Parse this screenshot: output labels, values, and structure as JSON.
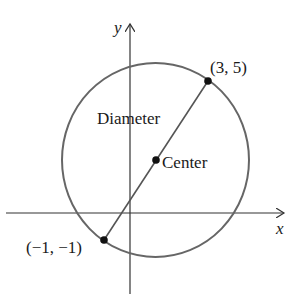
{
  "diagram": {
    "type": "circle-with-diameter",
    "axes": {
      "x_label": "x",
      "y_label": "y"
    },
    "labels": {
      "endpoint_upper": "(3, 5)",
      "endpoint_lower": "(−1, −1)",
      "diameter": "Diameter",
      "center": "Center"
    },
    "points": [
      {
        "name": "endpoint_upper",
        "coords": [
          3,
          5
        ]
      },
      {
        "name": "endpoint_lower",
        "coords": [
          -1,
          -1
        ]
      },
      {
        "name": "center",
        "coords": [
          1,
          2
        ]
      }
    ],
    "colors": {
      "circle_stroke": "#666666",
      "line_stroke": "#555555",
      "axis_stroke": "#333333",
      "point_fill": "#111111",
      "text": "#1a1a1a"
    }
  }
}
